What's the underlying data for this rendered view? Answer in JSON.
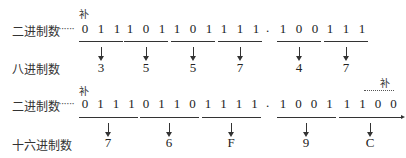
{
  "annotation": "补",
  "row1": {
    "binary_label": "二进制数",
    "leader": "······",
    "groups": [
      {
        "bits": [
          "0",
          "1",
          "1"
        ],
        "result": "3"
      },
      {
        "bits": [
          "1",
          "0",
          "1"
        ],
        "result": "5"
      },
      {
        "bits": [
          "1",
          "0",
          "1"
        ],
        "result": "5"
      },
      {
        "bits": [
          "1",
          "1",
          "1"
        ],
        "result": "7"
      },
      {
        "bits": [
          "1",
          "0",
          "0"
        ],
        "result": "4"
      },
      {
        "bits": [
          "1",
          "1",
          "1"
        ],
        "result": "7"
      }
    ],
    "point": ".",
    "target_label": "八进制数"
  },
  "row2": {
    "binary_label": "二进制数",
    "leader": "······",
    "groups": [
      {
        "bits": [
          "0",
          "1",
          "1",
          "1"
        ],
        "result": "7"
      },
      {
        "bits": [
          "0",
          "1",
          "1",
          "0"
        ],
        "result": "6"
      },
      {
        "bits": [
          "1",
          "1",
          "1",
          "1"
        ],
        "result": "F"
      },
      {
        "bits": [
          "1",
          "0",
          "0",
          "1"
        ],
        "result": "9"
      },
      {
        "bits": [
          "1",
          "1",
          "0",
          "0"
        ],
        "result": "C"
      }
    ],
    "point": ".",
    "target_label": "十六进制数"
  }
}
